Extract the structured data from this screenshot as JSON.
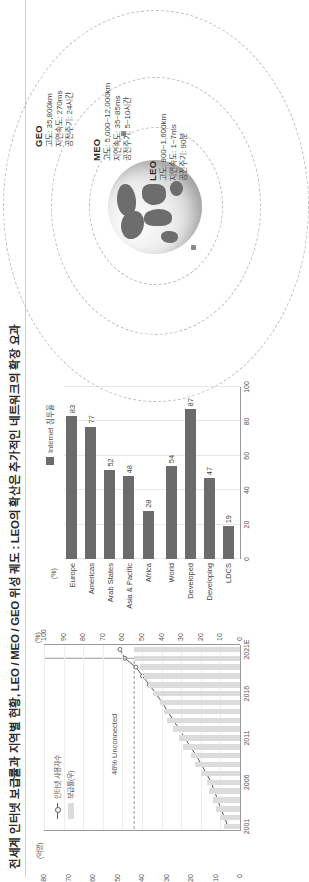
{
  "title": "전세계 인터넷 보급률과 지역별 현황, LEO / MEO / GEO 위성 궤도 : LEO의 확산은 추가적인 네트워크의 확장 요과",
  "chart_data": [
    {
      "type": "line",
      "title": "전세계 인터넷 사용자수 및 보급률",
      "xlabel": "",
      "ylabel": "(억명)",
      "y2label": "(%)",
      "ylim": [
        0,
        80
      ],
      "y2lim": [
        0,
        100
      ],
      "grid": true,
      "legend_position": "top-left",
      "unit_left": "(억명)",
      "unit_right": "(%)",
      "annotation": "46% Unconnected",
      "legend": [
        {
          "name": "인터넷 사용자수",
          "kind": "line"
        },
        {
          "name": "보급률(우)",
          "kind": "bar"
        }
      ],
      "x": [
        "2001",
        "2002",
        "2003",
        "2004",
        "2005",
        "2006",
        "2007",
        "2008",
        "2009",
        "2010",
        "2011",
        "2012",
        "2013",
        "2014",
        "2015",
        "2016",
        "2017",
        "2018",
        "2019",
        "2020",
        "2021E"
      ],
      "xticks": [
        "2001",
        "2006",
        "2011",
        "2016",
        "2021E"
      ],
      "yticks_left": [
        "0",
        "10",
        "20",
        "30",
        "40",
        "50",
        "60",
        "70",
        "80"
      ],
      "yticks_right": [
        "0",
        "10",
        "20",
        "30",
        "40",
        "50",
        "60",
        "70",
        "80",
        "90",
        "100"
      ],
      "series": [
        {
          "name": "인터넷 사용자수",
          "axis": "left",
          "values": [
            4.9,
            6.3,
            7.8,
            9.1,
            10.4,
            11.8,
            13.7,
            15.8,
            17.8,
            20.3,
            22.5,
            24.8,
            27.2,
            29.5,
            31.7,
            34.3,
            37.0,
            39.8,
            42.5,
            47.0,
            49.0
          ]
        },
        {
          "name": "보급률(우)",
          "axis": "right",
          "values": [
            8,
            10,
            12,
            14,
            16,
            17,
            20,
            23,
            25,
            29,
            31,
            34,
            37,
            39,
            41,
            44,
            47,
            49,
            51,
            54,
            54
          ]
        }
      ]
    },
    {
      "type": "bar",
      "orientation": "horizontal",
      "title": "지역별 인터넷 침투율",
      "unit": "(%)",
      "xlim": [
        0,
        100
      ],
      "xticks": [
        "0",
        "20",
        "40",
        "60",
        "80",
        "100"
      ],
      "legend": [
        "Internet 침투율"
      ],
      "legend_position": "top-right",
      "categories": [
        "Europe",
        "Americas",
        "Arab States",
        "Asia & Pacific",
        "Africa",
        "World",
        "Developed",
        "Developing",
        "LDCS"
      ],
      "values": [
        83,
        77,
        52,
        48,
        28,
        54,
        87,
        47,
        19
      ],
      "bar_color": "#6b6b6b"
    }
  ],
  "orbit": {
    "rings": [
      {
        "id": "LEO",
        "name": "LEO",
        "lines": [
          "고도: 800~1,600km",
          "지연속도: 1~7ms",
          "공전주기: 90분"
        ]
      },
      {
        "id": "MEO",
        "name": "MEO",
        "lines": [
          "고도: 5,000~12,000km",
          "지연속도: 35~85ms",
          "공전주기: 5~10시간"
        ]
      },
      {
        "id": "GEO",
        "name": "GEO",
        "lines": [
          "고도: 35,800km",
          "지연속도: 270ms",
          "공전주기: 24시간"
        ]
      }
    ]
  },
  "colors": {
    "bar": "#6b6b6b",
    "area": "#dcdcdc",
    "line": "#5d5d5d",
    "ring": "#bdbdbd",
    "text": "#3a3a3a"
  }
}
